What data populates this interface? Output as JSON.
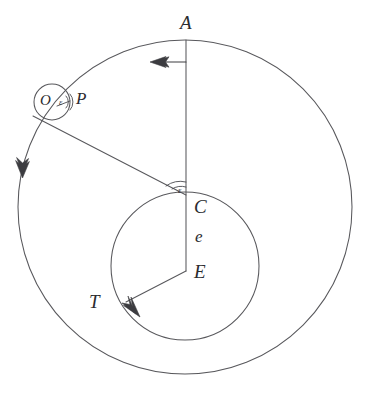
{
  "figure": {
    "type": "geometry-diagram",
    "background_color": "#ffffff",
    "stroke_color": "#58585c",
    "label_color": "#2b2b2f",
    "width": 368,
    "height": 393
  },
  "labels": {
    "A": "A",
    "C": "C",
    "E": "E",
    "T": "T",
    "P": "P",
    "O": "O",
    "e": "e",
    "epsilon_at_C": "ε",
    "epsilon_at_P": "ε"
  },
  "shapes": {
    "outer_circle": {
      "cx": 185,
      "cy": 207,
      "r": 167
    },
    "inner_circle": {
      "cx": 185,
      "cy": 266,
      "r": 74
    },
    "small_circle": {
      "cx": 52,
      "cy": 102,
      "r": 18
    }
  },
  "points": {
    "A": {
      "x": 186,
      "y": 40
    },
    "C": {
      "x": 186,
      "y": 194
    },
    "E": {
      "x": 186,
      "y": 271
    },
    "T": {
      "x": 126,
      "y": 302
    },
    "O": {
      "x": 52,
      "y": 102
    },
    "P": {
      "x": 70,
      "y": 101
    }
  },
  "segments": [
    {
      "name": "A-to-E",
      "from": "A",
      "to": "E"
    },
    {
      "name": "P-to-C-extended",
      "from": "O-region",
      "to": "C"
    },
    {
      "name": "E-to-T",
      "from": "E",
      "to": "T"
    }
  ],
  "arrows": [
    {
      "name": "top-left-arrow",
      "direction": "left",
      "on": "horizontal-segment-below-A"
    },
    {
      "name": "outer-circle-arrow",
      "direction": "down",
      "on": "outer-circle-left"
    },
    {
      "name": "inner-circle-arrow",
      "direction": "down-right",
      "on": "inner-circle-lower-left"
    }
  ],
  "angle_marks": [
    {
      "name": "angle-at-C",
      "label": "ε"
    },
    {
      "name": "angle-at-P",
      "label": "ε"
    }
  ]
}
